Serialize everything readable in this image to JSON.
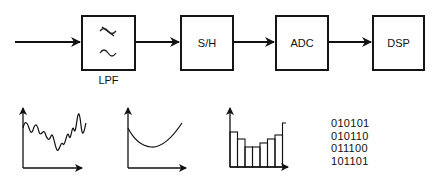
{
  "diagram": {
    "input": {
      "label": ""
    },
    "blocks": [
      {
        "id": "lpf",
        "label": "",
        "caption": "LPF",
        "icon": "low-pass-filter-icon",
        "symbols": [
          "≈ (crossed)",
          "~"
        ]
      },
      {
        "id": "sh",
        "label": "S/H",
        "caption": ""
      },
      {
        "id": "adc",
        "label": "ADC",
        "caption": ""
      },
      {
        "id": "dsp",
        "label": "DSP",
        "caption": ""
      }
    ],
    "edges": [
      {
        "from": "input",
        "to": "lpf"
      },
      {
        "from": "lpf",
        "to": "sh"
      },
      {
        "from": "sh",
        "to": "adc"
      },
      {
        "from": "adc",
        "to": "dsp"
      }
    ],
    "stage_illustrations": [
      {
        "id": "raw-signal",
        "type": "noisy-waveform-plot"
      },
      {
        "id": "filtered-signal",
        "type": "smooth-curve-plot"
      },
      {
        "id": "sampled-signal",
        "type": "staircase-bar-plot",
        "bar_heights_relative": [
          0.62,
          0.52,
          0.42,
          0.42,
          0.48,
          0.55,
          0.6,
          0.78
        ]
      },
      {
        "id": "digital-output",
        "type": "binary-words",
        "words": [
          "010101",
          "010110",
          "011100",
          "101101"
        ]
      }
    ]
  }
}
